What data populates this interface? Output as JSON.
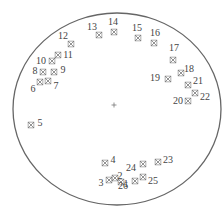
{
  "diagram": {
    "boundary": {
      "shape": "circle",
      "cx": 117,
      "cy": 109,
      "rx": 104,
      "ry": 96,
      "stroke": "#666666"
    },
    "center_mark": {
      "symbol": "+",
      "x": 114,
      "y": 105
    },
    "marker_color": "#777777",
    "label_color": "#444444",
    "points": [
      {
        "id": "1",
        "mx": 121,
        "my": 182,
        "lx": 126,
        "ly": 184
      },
      {
        "id": "2",
        "mx": 115,
        "my": 178,
        "lx": 120,
        "ly": 176
      },
      {
        "id": "3",
        "mx": 109,
        "my": 180,
        "lx": 101,
        "ly": 183
      },
      {
        "id": "4",
        "mx": 105,
        "my": 163,
        "lx": 113,
        "ly": 160
      },
      {
        "id": "5",
        "mx": 31,
        "my": 125,
        "lx": 40,
        "ly": 123
      },
      {
        "id": "6",
        "mx": 40,
        "my": 82,
        "lx": 33,
        "ly": 89
      },
      {
        "id": "7",
        "mx": 48,
        "my": 81,
        "lx": 56,
        "ly": 86
      },
      {
        "id": "8",
        "mx": 43,
        "my": 72,
        "lx": 35,
        "ly": 71
      },
      {
        "id": "9",
        "mx": 54,
        "my": 72,
        "lx": 63,
        "ly": 70
      },
      {
        "id": "10",
        "mx": 52,
        "my": 61,
        "lx": 41,
        "ly": 61
      },
      {
        "id": "11",
        "mx": 58,
        "my": 55,
        "lx": 68,
        "ly": 55
      },
      {
        "id": "12",
        "mx": 71,
        "my": 44,
        "lx": 63,
        "ly": 36
      },
      {
        "id": "13",
        "mx": 99,
        "my": 35,
        "lx": 92,
        "ly": 27
      },
      {
        "id": "14",
        "mx": 114,
        "my": 32,
        "lx": 113,
        "ly": 22
      },
      {
        "id": "15",
        "mx": 138,
        "my": 38,
        "lx": 137,
        "ly": 28
      },
      {
        "id": "16",
        "mx": 154,
        "my": 43,
        "lx": 155,
        "ly": 33
      },
      {
        "id": "17",
        "mx": 173,
        "my": 60,
        "lx": 174,
        "ly": 48
      },
      {
        "id": "18",
        "mx": 181,
        "my": 73,
        "lx": 189,
        "ly": 69
      },
      {
        "id": "19",
        "mx": 168,
        "my": 79,
        "lx": 155,
        "ly": 78
      },
      {
        "id": "20",
        "mx": 188,
        "my": 101,
        "lx": 178,
        "ly": 101
      },
      {
        "id": "21",
        "mx": 188,
        "my": 85,
        "lx": 198,
        "ly": 81
      },
      {
        "id": "22",
        "mx": 195,
        "my": 93,
        "lx": 205,
        "ly": 97
      },
      {
        "id": "23",
        "mx": 158,
        "my": 162,
        "lx": 168,
        "ly": 160
      },
      {
        "id": "24",
        "mx": 143,
        "my": 164,
        "lx": 131,
        "ly": 168
      },
      {
        "id": "25",
        "mx": 143,
        "my": 177,
        "lx": 153,
        "ly": 181
      },
      {
        "id": "26",
        "mx": 135,
        "my": 181,
        "lx": 123,
        "ly": 186
      }
    ]
  }
}
